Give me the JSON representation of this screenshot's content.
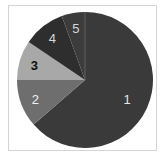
{
  "chart_data": {
    "type": "pie",
    "title": "",
    "start_angle": "12 o'clock",
    "direction": "clockwise",
    "center": [
      85,
      80
    ],
    "radius": 68,
    "slices": [
      {
        "label": "1",
        "value": 63.6,
        "start_deg": 0,
        "end_deg": 229,
        "color": "#3a3a3a",
        "label_color": "#e6e6e6"
      },
      {
        "label": "2",
        "value": 11.4,
        "start_deg": 229,
        "end_deg": 270,
        "color": "#6e6e6e",
        "label_color": "#f0f0f0"
      },
      {
        "label": "3",
        "value": 9.4,
        "start_deg": 270,
        "end_deg": 304,
        "color": "#a8a8a8",
        "label_color": "#111111"
      },
      {
        "label": "4",
        "value": 10.0,
        "start_deg": 304,
        "end_deg": 340,
        "color": "#2e2e2e",
        "label_color": "#d8d8d8"
      },
      {
        "label": "5",
        "value": 5.6,
        "start_deg": 340,
        "end_deg": 360,
        "color": "#3c3c3c",
        "label_color": "#d8d8d8"
      }
    ],
    "categories": [
      "1",
      "2",
      "3",
      "4",
      "5"
    ],
    "values": [
      63.6,
      11.4,
      9.4,
      10.0,
      5.6
    ],
    "legend": "none",
    "grid": false
  },
  "frame": {
    "border_color": "#d4d4d4"
  }
}
